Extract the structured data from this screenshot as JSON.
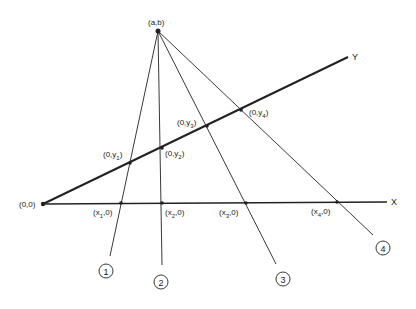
{
  "diagram": {
    "type": "projective-lines",
    "origin": {
      "label": "(0,0)",
      "x": 43,
      "y": 204
    },
    "apex": {
      "label": "(a,b)",
      "x": 158,
      "y": 31
    },
    "x_axis": {
      "label": "X",
      "end": {
        "x": 387,
        "y": 202
      }
    },
    "y_axis": {
      "label": "Y",
      "end": {
        "x": 348,
        "y": 57
      }
    },
    "lines": [
      {
        "id": "1",
        "number": "1",
        "x_int": {
          "label_pre": "(x",
          "sub": "1",
          "label_post": ",0)",
          "x": 121,
          "y": 203
        },
        "y_int": {
          "label_pre": "(0,y",
          "sub": "1",
          "label_post": ")",
          "x": 130,
          "y": 163
        },
        "end": {
          "x": 110,
          "y": 256
        },
        "circle": {
          "x": 106,
          "y": 271
        }
      },
      {
        "id": "2",
        "number": "2",
        "x_int": {
          "label_pre": "(x",
          "sub": "2",
          "label_post": ",0)",
          "x": 162,
          "y": 203
        },
        "y_int": {
          "label_pre": "(0,y",
          "sub": "2",
          "label_post": ")",
          "x": 162,
          "y": 148
        },
        "end": {
          "x": 162,
          "y": 265
        },
        "circle": {
          "x": 161,
          "y": 282
        }
      },
      {
        "id": "3",
        "number": "3",
        "x_int": {
          "label_pre": "(x",
          "sub": "3",
          "label_post": ",0)",
          "x": 246,
          "y": 203
        },
        "y_int": {
          "label_pre": "(0,y",
          "sub": "3",
          "label_post": ")",
          "x": 207,
          "y": 126
        },
        "end": {
          "x": 276,
          "y": 264
        },
        "circle": {
          "x": 283,
          "y": 279
        }
      },
      {
        "id": "4",
        "number": "4",
        "x_int": {
          "label_pre": "(x",
          "sub": "4",
          "label_post": ",0)",
          "x": 337,
          "y": 202
        },
        "y_int": {
          "label_pre": "(0,y",
          "sub": "4",
          "label_post": ")",
          "x": 241,
          "y": 110
        },
        "end": {
          "x": 373,
          "y": 235
        },
        "circle": {
          "x": 383,
          "y": 248
        }
      }
    ],
    "colors": {
      "ink": "#222222",
      "background": "#ffffff"
    }
  }
}
